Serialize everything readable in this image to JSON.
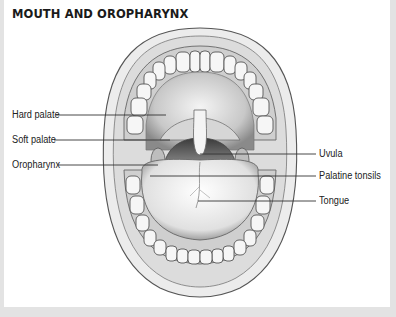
{
  "figure": {
    "title": "MOUTH AND OROPHARYNX",
    "labels_left": [
      {
        "text": "Hard palate",
        "y": 115
      },
      {
        "text": "Soft palate",
        "y": 140
      },
      {
        "text": "Oropharynx",
        "y": 165
      }
    ],
    "labels_right": [
      {
        "text": "Uvula",
        "y": 154
      },
      {
        "text": "Palatine tonsils",
        "y": 176
      },
      {
        "text": "Tongue",
        "y": 201
      }
    ]
  },
  "colors": {
    "frame": "#e3e3e3",
    "panel": "#ffffff",
    "line": "#333333",
    "ink": "#555555"
  }
}
